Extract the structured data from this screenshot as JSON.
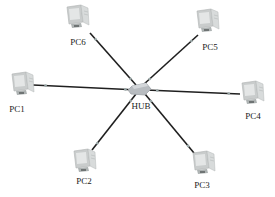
{
  "diagram": {
    "type": "star-topology",
    "hub": {
      "label": "HUB",
      "x": 140,
      "y": 89
    },
    "nodes": [
      {
        "id": "pc1",
        "label": "PC1",
        "icon": "computer-icon",
        "x": 22,
        "y": 84,
        "label_x": 17,
        "label_y": 104
      },
      {
        "id": "pc2",
        "label": "PC2",
        "icon": "computer-icon",
        "x": 84,
        "y": 161,
        "label_x": 84,
        "label_y": 176
      },
      {
        "id": "pc3",
        "label": "PC3",
        "icon": "computer-icon",
        "x": 203,
        "y": 163,
        "label_x": 202,
        "label_y": 180
      },
      {
        "id": "pc4",
        "label": "PC4",
        "icon": "computer-icon",
        "x": 252,
        "y": 93,
        "label_x": 253,
        "label_y": 111
      },
      {
        "id": "pc5",
        "label": "PC5",
        "icon": "computer-icon",
        "x": 207,
        "y": 21,
        "label_x": 210,
        "label_y": 42
      },
      {
        "id": "pc6",
        "label": "PC6",
        "icon": "computer-icon",
        "x": 77,
        "y": 17,
        "label_x": 78,
        "label_y": 37
      }
    ],
    "edges": [
      {
        "from": "hub",
        "to": "pc1",
        "x1": 138,
        "y1": 90,
        "x2": 33,
        "y2": 85
      },
      {
        "from": "hub",
        "to": "pc2",
        "x1": 136,
        "y1": 94,
        "x2": 92,
        "y2": 150
      },
      {
        "from": "hub",
        "to": "pc3",
        "x1": 145,
        "y1": 94,
        "x2": 194,
        "y2": 153
      },
      {
        "from": "hub",
        "to": "pc4",
        "x1": 146,
        "y1": 90,
        "x2": 240,
        "y2": 94
      },
      {
        "from": "hub",
        "to": "pc5",
        "x1": 143,
        "y1": 85,
        "x2": 198,
        "y2": 35
      },
      {
        "from": "hub",
        "to": "pc6",
        "x1": 136,
        "y1": 85,
        "x2": 90,
        "y2": 33
      }
    ],
    "colors": {
      "link": "#1f1f1f",
      "link_marker": "#9aa8a8",
      "hub_fill": "#b8bcc0",
      "pc_body": "#c9cccc",
      "pc_screen": "#e4e6e6",
      "label": "#222222"
    }
  }
}
